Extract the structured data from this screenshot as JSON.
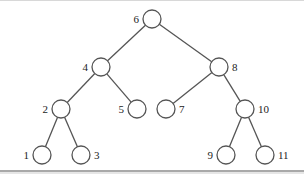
{
  "diagram": {
    "type": "binary-search-tree",
    "colors": {
      "stroke": "#555555",
      "label": "#222222",
      "background": "#ffffff"
    },
    "node_radius": 9,
    "nodes": [
      {
        "id": "6",
        "label": "6",
        "x": 152,
        "y": 19,
        "label_side": "left"
      },
      {
        "id": "4",
        "label": "4",
        "x": 101,
        "y": 67,
        "label_side": "left"
      },
      {
        "id": "8",
        "label": "8",
        "x": 219,
        "y": 67,
        "label_side": "right"
      },
      {
        "id": "2",
        "label": "2",
        "x": 61,
        "y": 109,
        "label_side": "left"
      },
      {
        "id": "5",
        "label": "5",
        "x": 137,
        "y": 109,
        "label_side": "left"
      },
      {
        "id": "7",
        "label": "7",
        "x": 166,
        "y": 109,
        "label_side": "right"
      },
      {
        "id": "10",
        "label": "10",
        "x": 245,
        "y": 109,
        "label_side": "right"
      },
      {
        "id": "1",
        "label": "1",
        "x": 42,
        "y": 155,
        "label_side": "left"
      },
      {
        "id": "3",
        "label": "3",
        "x": 81,
        "y": 155,
        "label_side": "right"
      },
      {
        "id": "9",
        "label": "9",
        "x": 226,
        "y": 155,
        "label_side": "left"
      },
      {
        "id": "11",
        "label": "11",
        "x": 265,
        "y": 155,
        "label_side": "right"
      }
    ],
    "edges": [
      {
        "from": "6",
        "to": "4"
      },
      {
        "from": "6",
        "to": "8"
      },
      {
        "from": "4",
        "to": "2"
      },
      {
        "from": "4",
        "to": "5"
      },
      {
        "from": "8",
        "to": "7"
      },
      {
        "from": "8",
        "to": "10"
      },
      {
        "from": "2",
        "to": "1"
      },
      {
        "from": "2",
        "to": "3"
      },
      {
        "from": "10",
        "to": "9"
      },
      {
        "from": "10",
        "to": "11"
      }
    ]
  }
}
